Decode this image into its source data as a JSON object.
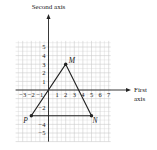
{
  "diagram": {
    "y_axis_label": "Second axis",
    "x_axis_label_line1": "First",
    "x_axis_label_line2": "axis",
    "x_ticks": [
      "−3",
      "−2",
      "−1",
      "1",
      "2",
      "3",
      "4",
      "5",
      "6",
      "7"
    ],
    "x_tick_values": [
      -3,
      -2,
      -1,
      1,
      2,
      3,
      4,
      5,
      6,
      7
    ],
    "y_ticks": [
      "5",
      "4",
      "3",
      "2",
      "1",
      "−2",
      "−4",
      "−5"
    ],
    "y_tick_values": [
      5,
      4,
      3,
      2,
      1,
      -2,
      -4,
      -5
    ],
    "points": [
      {
        "name": "M",
        "x": 2,
        "y": 3
      },
      {
        "name": "N",
        "x": 5,
        "y": -3
      },
      {
        "name": "P",
        "x": -2,
        "y": -3
      }
    ],
    "triangle": [
      "M",
      "N",
      "P"
    ],
    "grid": {
      "x_min": -4,
      "x_max": 7,
      "y_min": -6,
      "y_max": 6
    },
    "colors": {
      "grid": "#c8c8c8",
      "axis": "#222222",
      "shape": "#222222",
      "text": "#1a1a1a"
    }
  }
}
